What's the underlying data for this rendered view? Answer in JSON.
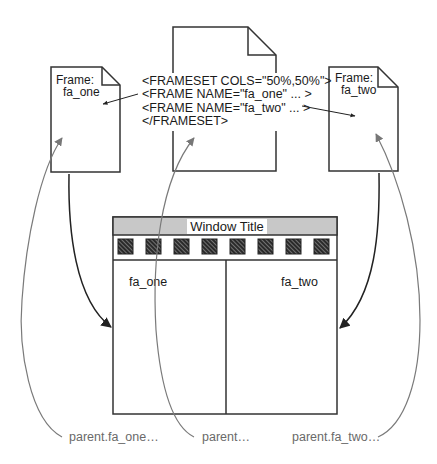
{
  "frames": {
    "left": {
      "heading": "Frame:",
      "name": "fa_one"
    },
    "right": {
      "heading": "Frame:",
      "name": "fa_two"
    }
  },
  "frameset_code": [
    "<FRAMESET COLS=\"50%,50%\">",
    "<FRAME NAME=\"fa_one\" ... >",
    "<FRAME NAME=\"fa_two\" ... >",
    "</FRAMESET>"
  ],
  "window": {
    "title": "Window Title",
    "toolbar_icon_count": 8,
    "left_pane_label": "fa_one",
    "right_pane_label": "fa_two"
  },
  "captions": {
    "left": "parent.fa_one…",
    "center": "parent…",
    "right": "parent.fa_two…"
  },
  "colors": {
    "stroke": "#333333",
    "curve_gray": "#7a7a7a",
    "title_bar": "#c8c8c8",
    "caption_text": "#6a6a6a"
  }
}
